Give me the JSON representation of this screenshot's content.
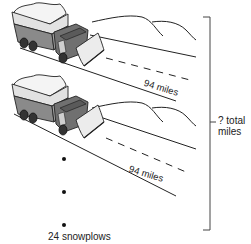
{
  "diagram": {
    "type": "snowplow-distance-illustration",
    "snowplows": [
      {
        "label": "snowplow-1",
        "distance_label": "94 miles"
      },
      {
        "label": "snowplow-2",
        "distance_label": "94 miles"
      }
    ],
    "continuation": "vertical ellipsis (3 dots)",
    "count_label": "24 snowplows",
    "total_label_line1": "? total",
    "total_label_line2": "miles",
    "colors": {
      "line": "#222222",
      "truck_body": "#8a8a8a",
      "truck_dark": "#555555",
      "truck_light": "#e8e8e8",
      "background": "#ffffff"
    }
  }
}
